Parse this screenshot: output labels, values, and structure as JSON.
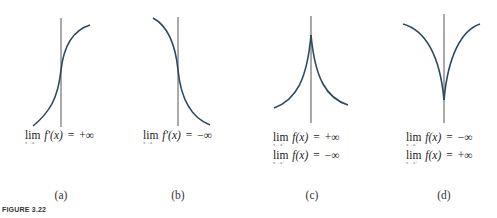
{
  "figure_label": "FIGURE 3.22",
  "colors": {
    "curve": "#2c4a5e",
    "axis": "#555555",
    "text": "#222222"
  },
  "panels": [
    {
      "caption": "(a)",
      "limits": [
        {
          "op": "lim",
          "sub": "x→a",
          "expr": "f′(x)",
          "eq": "=",
          "value": "+∞"
        }
      ]
    },
    {
      "caption": "(b)",
      "limits": [
        {
          "op": "lim",
          "sub": "x→a",
          "expr": "f′(x)",
          "eq": "=",
          "value": "−∞"
        }
      ]
    },
    {
      "caption": "(c)",
      "limits": [
        {
          "op": "lim",
          "sub": "x→a⁻",
          "expr": "f(x)",
          "eq": "=",
          "value": "+∞"
        },
        {
          "op": "lim",
          "sub": "x→a⁺",
          "expr": "f(x)",
          "eq": "=",
          "value": "−∞"
        }
      ]
    },
    {
      "caption": "(d)",
      "limits": [
        {
          "op": "lim",
          "sub": "x→a⁻",
          "expr": "f(x)",
          "eq": "=",
          "value": "−∞"
        },
        {
          "op": "lim",
          "sub": "x→a⁺",
          "expr": "f(x)",
          "eq": "=",
          "value": "+∞"
        }
      ]
    }
  ]
}
